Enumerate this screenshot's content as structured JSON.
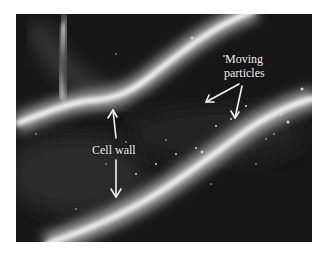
{
  "figure": {
    "background_color": "#141414",
    "wall_color": "#ffffff"
  },
  "annotations": {
    "cell_wall": {
      "label": "Cell wall"
    },
    "moving_particles": {
      "line1": "Moving",
      "line2": "particles"
    }
  }
}
